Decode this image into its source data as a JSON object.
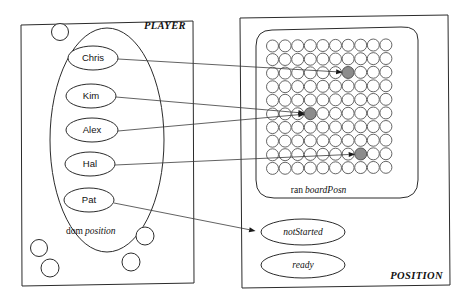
{
  "diagram": {
    "panels": [
      {
        "id": "player",
        "label": "PLAYER",
        "label_style": "italic-bold-caps",
        "set_caption_roman": "dom",
        "set_caption_italic": "position",
        "members": [
          {
            "name": "Chris"
          },
          {
            "name": "Kim"
          },
          {
            "name": "Alex"
          },
          {
            "name": "Hal"
          },
          {
            "name": "Pat"
          }
        ],
        "free_elements_count": 5
      },
      {
        "id": "position",
        "label": "POSITION",
        "label_style": "italic-bold-caps",
        "grid_caption_roman": "ran",
        "grid_caption_italic": "boardPosn",
        "grid": {
          "columns": 10,
          "rows": 10,
          "occupied_cells": [
            {
              "col": 6,
              "row": 2
            },
            {
              "col": 3,
              "row": 5
            },
            {
              "col": 7,
              "row": 8
            }
          ]
        },
        "states": [
          {
            "name": "notStarted"
          },
          {
            "name": "ready"
          }
        ]
      }
    ],
    "mappings": [
      {
        "from": "Chris",
        "to": "grid-cell-6-2"
      },
      {
        "from": "Kim",
        "to": "grid-cell-3-5"
      },
      {
        "from": "Alex",
        "to": "grid-cell-3-5"
      },
      {
        "from": "Hal",
        "to": "grid-cell-7-8"
      },
      {
        "from": "Pat",
        "to": "notStarted"
      }
    ],
    "colors": {
      "stroke": "#2b2b2b",
      "grid_stroke": "#555555",
      "occupied_fill": "#8c8c8c",
      "background": "#ffffff",
      "connector": "#3a3a3a"
    }
  }
}
